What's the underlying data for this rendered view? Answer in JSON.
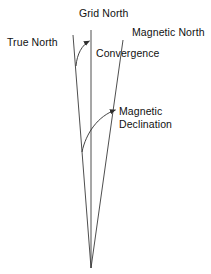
{
  "diagram": {
    "background_color": "#ffffff",
    "line_color": "#3a3a3a",
    "text_color": "#111111",
    "labels": {
      "true_north": "True North",
      "grid_north": "Grid North",
      "magnetic_north": "Magnetic North",
      "convergence": "Convergence",
      "magnetic_declination_line1": "Magnetic",
      "magnetic_declination_line2": "Declination"
    },
    "lines": [
      {
        "name": "true-north-line",
        "label": "True North",
        "x1": 73,
        "y1": 35,
        "x2": 91,
        "y2": 268
      },
      {
        "name": "grid-north-line",
        "label": "Grid North",
        "x1": 91,
        "y1": 30,
        "x2": 91,
        "y2": 268
      },
      {
        "name": "magnetic-north-line",
        "label": "Magnetic North",
        "x1": 123,
        "y1": 40,
        "x2": 91,
        "y2": 268
      }
    ],
    "arrows": [
      {
        "name": "convergence-arrow",
        "label": "Convergence",
        "from_line": "true-north-line",
        "to_line": "grid-north-line",
        "start_x": 76,
        "start_y": 64,
        "end_x": 90,
        "end_y": 40
      },
      {
        "name": "magnetic-declination-arrow",
        "label": "Magnetic Declination",
        "from_line": "true-north-line",
        "to_line": "magnetic-north-line",
        "start_x": 82,
        "start_y": 152,
        "end_x": 117,
        "end_y": 109
      }
    ],
    "convergence_point": {
      "x": 91,
      "y": 268
    }
  }
}
